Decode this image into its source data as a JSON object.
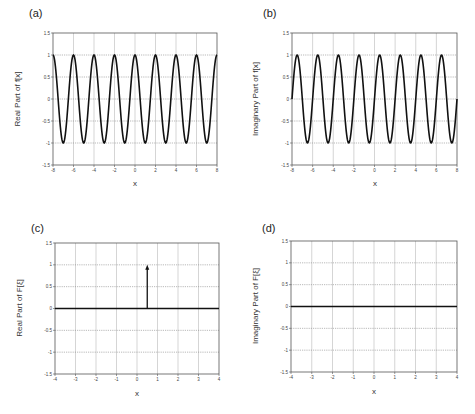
{
  "chart_data": [
    {
      "panel": "(a)",
      "type": "line",
      "title": "",
      "xlabel": "x",
      "ylabel": "Real Part of f[x]",
      "xlim": [
        -8,
        8
      ],
      "ylim": [
        -1.5,
        1.5
      ],
      "xticks": [
        -8,
        -6,
        -4,
        -2,
        0,
        2,
        4,
        6,
        8
      ],
      "yticks": [
        1.5,
        1,
        0.5,
        0,
        -0.5,
        -1,
        -1.5
      ],
      "grid": true,
      "function": "cos(pi*x)",
      "series": [
        {
          "name": "Re f[x]",
          "function": "cos(pi x)",
          "amplitude": 1,
          "period": 2,
          "phase": 0
        }
      ],
      "geom": {
        "x0": 53,
        "x1": 217,
        "y0": 33,
        "y1": 165
      }
    },
    {
      "panel": "(b)",
      "type": "line",
      "title": "",
      "xlabel": "x",
      "ylabel": "Imaginary Part of f[x]",
      "xlim": [
        -8,
        8
      ],
      "ylim": [
        -1.5,
        1.5
      ],
      "xticks": [
        -8,
        -6,
        -4,
        -2,
        0,
        2,
        4,
        6,
        8
      ],
      "yticks": [
        1.5,
        1,
        0.5,
        0,
        -0.5,
        -1,
        -1.5
      ],
      "grid": true,
      "function": "sin(pi*x)",
      "series": [
        {
          "name": "Im f[x]",
          "function": "sin(pi x)",
          "amplitude": 1,
          "period": 2,
          "phase": -1.5708
        }
      ],
      "geom": {
        "x0": 292,
        "x1": 457,
        "y0": 33,
        "y1": 165
      }
    },
    {
      "panel": "(c)",
      "type": "line",
      "title": "",
      "xlabel": "x",
      "ylabel": "Real Part of F[ξ]",
      "xlim": [
        -4,
        4
      ],
      "ylim": [
        -1.5,
        1.5
      ],
      "xticks": [
        -4,
        -3,
        -2,
        -1,
        0,
        1,
        2,
        3,
        4
      ],
      "yticks": [
        1.5,
        1,
        0.5,
        0,
        -0.5,
        -1,
        -1.5
      ],
      "grid": true,
      "series": [
        {
          "name": "baseline",
          "x": [
            -4,
            4
          ],
          "y": [
            0,
            0
          ]
        },
        {
          "name": "delta",
          "kind": "arrow",
          "x": 0.5,
          "y": 1
        }
      ],
      "geom": {
        "x0": 55,
        "x1": 219,
        "y0": 243,
        "y1": 374
      }
    },
    {
      "panel": "(d)",
      "type": "line",
      "title": "",
      "xlabel": "x",
      "ylabel": "Imaginary Part of F[ξ]",
      "xlim": [
        -4,
        4
      ],
      "ylim": [
        -1.5,
        1.5
      ],
      "xticks": [
        -4,
        -3,
        -2,
        -1,
        0,
        1,
        2,
        3,
        4
      ],
      "yticks": [
        1.5,
        1,
        0.5,
        0,
        -0.5,
        -1,
        -1.5
      ],
      "grid": true,
      "series": [
        {
          "name": "zero",
          "x": [
            -4,
            4
          ],
          "y": [
            0,
            0
          ]
        }
      ],
      "geom": {
        "x0": 291,
        "x1": 457,
        "y0": 241,
        "y1": 372
      }
    }
  ],
  "panels": {
    "a": {
      "label": "(a)",
      "ylabel": "Real Part of f[x]",
      "xlabel": "x"
    },
    "b": {
      "label": "(b)",
      "ylabel": "Imaginary Part of f[x]",
      "xlabel": "x"
    },
    "c": {
      "label": "(c)",
      "ylabel": "Real Part of F[ξ]",
      "xlabel": "x"
    },
    "d": {
      "label": "(d)",
      "ylabel": "Imaginary Part of F[ξ]",
      "xlabel": "x"
    }
  },
  "colors": {
    "line": "#111111",
    "grid": "#9a9a9a",
    "axis": "#555555",
    "text": "#333333"
  }
}
